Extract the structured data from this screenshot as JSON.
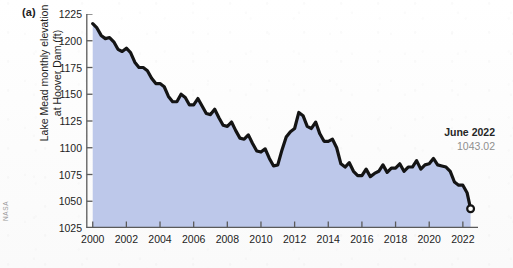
{
  "figure": {
    "panel_label": "(a)",
    "credit": "NASA"
  },
  "annotation": {
    "title": "June 2022",
    "value": "1043.02"
  },
  "chart_data": {
    "type": "area",
    "title": "",
    "xlabel": "",
    "ylabel": "Lake Mead monthly elevation\nat Hoover Dam (ft)",
    "xlim": [
      1999.6,
      2022.9
    ],
    "ylim": [
      1025,
      1225
    ],
    "grid": false,
    "legend": null,
    "fill_color": "#bdc8ea",
    "line_color": "#141414",
    "endpoint_marker": "open-circle",
    "xticks": [
      2000,
      2002,
      2004,
      2006,
      2008,
      2010,
      2012,
      2014,
      2016,
      2018,
      2020,
      2022
    ],
    "yticks": [
      1025,
      1050,
      1075,
      1100,
      1125,
      1150,
      1175,
      1200,
      1225
    ],
    "series": [
      {
        "name": "Lake Mead monthly elevation at Hoover Dam",
        "units": "ft",
        "x": [
          2000.0,
          2000.25,
          2000.5,
          2000.75,
          2001.0,
          2001.25,
          2001.5,
          2001.75,
          2002.0,
          2002.25,
          2002.5,
          2002.75,
          2003.0,
          2003.25,
          2003.5,
          2003.75,
          2004.0,
          2004.25,
          2004.5,
          2004.75,
          2005.0,
          2005.25,
          2005.5,
          2005.75,
          2006.0,
          2006.25,
          2006.5,
          2006.75,
          2007.0,
          2007.25,
          2007.5,
          2007.75,
          2008.0,
          2008.25,
          2008.5,
          2008.75,
          2009.0,
          2009.25,
          2009.5,
          2009.75,
          2010.0,
          2010.25,
          2010.5,
          2010.75,
          2011.0,
          2011.25,
          2011.5,
          2011.75,
          2012.0,
          2012.25,
          2012.5,
          2012.75,
          2013.0,
          2013.25,
          2013.5,
          2013.75,
          2014.0,
          2014.25,
          2014.5,
          2014.75,
          2015.0,
          2015.25,
          2015.5,
          2015.75,
          2016.0,
          2016.25,
          2016.5,
          2016.75,
          2017.0,
          2017.25,
          2017.5,
          2017.75,
          2018.0,
          2018.25,
          2018.5,
          2018.75,
          2019.0,
          2019.25,
          2019.5,
          2019.75,
          2020.0,
          2020.25,
          2020.5,
          2020.75,
          2021.0,
          2021.25,
          2021.5,
          2021.75,
          2022.0,
          2022.25,
          2022.46
        ],
        "y": [
          1216,
          1212,
          1205,
          1202,
          1203,
          1199,
          1192,
          1190,
          1193,
          1189,
          1180,
          1175,
          1175,
          1172,
          1165,
          1160,
          1160,
          1157,
          1148,
          1143,
          1143,
          1150,
          1147,
          1140,
          1140,
          1146,
          1139,
          1132,
          1131,
          1136,
          1128,
          1121,
          1120,
          1124,
          1116,
          1109,
          1108,
          1112,
          1104,
          1097,
          1096,
          1099,
          1090,
          1083,
          1084,
          1098,
          1110,
          1115,
          1118,
          1133,
          1130,
          1120,
          1118,
          1124,
          1113,
          1106,
          1106,
          1108,
          1100,
          1085,
          1082,
          1086,
          1078,
          1074,
          1074,
          1080,
          1073,
          1076,
          1078,
          1084,
          1077,
          1081,
          1081,
          1085,
          1078,
          1082,
          1082,
          1088,
          1080,
          1084,
          1085,
          1090,
          1084,
          1083,
          1082,
          1078,
          1068,
          1065,
          1065,
          1058,
          1043
        ]
      }
    ]
  }
}
